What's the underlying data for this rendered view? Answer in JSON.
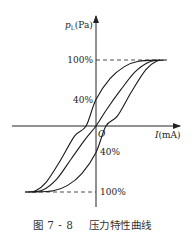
{
  "chart_data": {
    "type": "line",
    "title": "",
    "caption": "图 7 - 8    压力特性曲线",
    "xlabel": "I(mA)",
    "ylabel_main": "p",
    "ylabel_sub": "L",
    "ylabel_unit": "(Pa)",
    "origin_label": "O",
    "grid": false,
    "y_ticks": [
      {
        "value": 100,
        "label": "100%",
        "side": "left"
      },
      {
        "value": 40,
        "label": "40%",
        "side": "left"
      },
      {
        "value": -40,
        "label": "40%",
        "side": "right"
      },
      {
        "value": -100,
        "label": "100%",
        "side": "right"
      }
    ],
    "xlim": [
      -1,
      1
    ],
    "ylim": [
      -100,
      100
    ],
    "series": [
      {
        "name": "curve-left",
        "points": [
          [
            -1.0,
            -100
          ],
          [
            -0.85,
            -98
          ],
          [
            -0.7,
            -85
          ],
          [
            -0.5,
            -52
          ],
          [
            -0.3,
            -15
          ],
          [
            -0.14,
            0
          ],
          [
            0.0,
            40
          ],
          [
            0.2,
            72
          ],
          [
            0.4,
            90
          ],
          [
            0.6,
            98
          ],
          [
            0.9,
            100
          ]
        ]
      },
      {
        "name": "curve-middle",
        "points": [
          [
            -0.95,
            -100
          ],
          [
            -0.75,
            -97
          ],
          [
            -0.55,
            -80
          ],
          [
            -0.35,
            -50
          ],
          [
            -0.15,
            -20
          ],
          [
            0.0,
            0
          ],
          [
            0.15,
            25
          ],
          [
            0.35,
            55
          ],
          [
            0.55,
            82
          ],
          [
            0.75,
            97
          ],
          [
            0.95,
            100
          ]
        ]
      },
      {
        "name": "curve-right",
        "points": [
          [
            -0.9,
            -100
          ],
          [
            -0.6,
            -98
          ],
          [
            -0.4,
            -90
          ],
          [
            -0.2,
            -72
          ],
          [
            0.0,
            -40
          ],
          [
            0.14,
            0
          ],
          [
            0.3,
            15
          ],
          [
            0.5,
            52
          ],
          [
            0.7,
            85
          ],
          [
            0.85,
            98
          ],
          [
            1.0,
            100
          ]
        ]
      }
    ],
    "reference_lines": [
      {
        "type": "dashed",
        "y": 100,
        "from_x": 0,
        "to_x": 0.9
      },
      {
        "type": "dashed",
        "y": -100,
        "from_x": -1.0,
        "to_x": 0
      }
    ]
  }
}
